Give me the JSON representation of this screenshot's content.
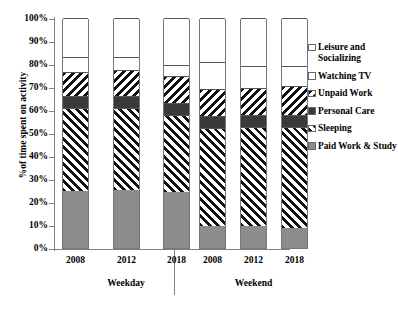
{
  "chart_data": {
    "type": "bar",
    "subtype": "stacked-bar-100-percent",
    "title": "",
    "xlabel": "",
    "ylabel": "%of time spent on activity",
    "ylim": [
      0,
      100
    ],
    "ytick_labels": [
      "100%",
      "90%",
      "80%",
      "70%",
      "60%",
      "50%",
      "40%",
      "30%",
      "20%",
      "10%",
      "0%"
    ],
    "ytick_values": [
      100,
      90,
      80,
      70,
      60,
      50,
      40,
      30,
      20,
      10,
      0
    ],
    "grid": false,
    "legend_position": "right",
    "categories": [
      "2008",
      "2012",
      "2018",
      "2008",
      "2012",
      "2018"
    ],
    "groups": [
      {
        "label": "Weekday",
        "categories": [
          "2008",
          "2012",
          "2018"
        ]
      },
      {
        "label": "Weekend",
        "categories": [
          "2008",
          "2012",
          "2018"
        ]
      }
    ],
    "series": [
      {
        "name": "Paid Work & Study",
        "pattern": "solid-gray",
        "color": "#8c8c8c",
        "values": [
          24.8,
          25.4,
          24.4,
          9.5,
          9.5,
          8.7
        ]
      },
      {
        "name": "Sleeping",
        "pattern": "diagonal-stripes-up",
        "color": "#111111",
        "values": [
          36.0,
          35.4,
          33.4,
          42.8,
          43.0,
          43.9
        ]
      },
      {
        "name": "Personal Care",
        "pattern": "solid-dark",
        "color": "#3a3a3a",
        "values": [
          5.2,
          5.2,
          5.2,
          5.2,
          5.2,
          5.2
        ]
      },
      {
        "name": "Unpaid Work",
        "pattern": "diagonal-stripes-down",
        "color": "#111111",
        "values": [
          10.5,
          11.3,
          11.8,
          11.7,
          12.0,
          12.6
        ]
      },
      {
        "name": "Watching TV",
        "pattern": "checkerboard",
        "color": "#1a1a1a",
        "values": [
          6.5,
          5.7,
          4.8,
          11.8,
          9.6,
          8.7
        ]
      },
      {
        "name": "Leisure and Socializing",
        "pattern": "white",
        "color": "#ffffff",
        "values": [
          17.0,
          17.0,
          20.4,
          19.0,
          20.7,
          20.9
        ]
      }
    ],
    "legend": [
      {
        "label": "Leisure and Socializing",
        "pattern": "white"
      },
      {
        "label": "Watching TV",
        "pattern": "checkerboard"
      },
      {
        "label": "Unpaid Work",
        "pattern": "diagonal-stripes-down"
      },
      {
        "label": "Personal Care",
        "pattern": "solid-dark"
      },
      {
        "label": "Sleeping",
        "pattern": "diagonal-stripes-up"
      },
      {
        "label": "Paid Work & Study",
        "pattern": "solid-gray"
      }
    ]
  },
  "colors": {
    "paid_work": "#8c8c8c",
    "personal_care": "#3a3a3a",
    "pattern_ink": "#111111",
    "axis": "#808080",
    "background": "#ffffff"
  }
}
